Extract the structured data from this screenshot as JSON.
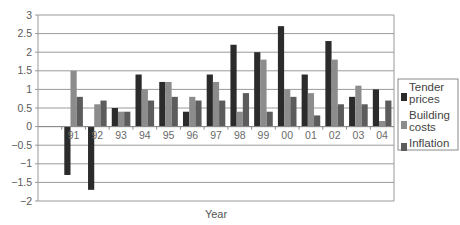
{
  "chart_data": {
    "type": "bar",
    "title": "",
    "xlabel": "Year",
    "ylabel": "",
    "ylim": [
      -2,
      3
    ],
    "yticks": [
      3,
      2.5,
      2,
      1.5,
      1,
      0.5,
      0,
      -0.5,
      -1,
      -1.5,
      -2
    ],
    "ytick_labels": [
      "3",
      "2.5",
      "2",
      "1.5",
      "1",
      "0.5",
      "0",
      "−0.5",
      "−1",
      "−1.5",
      "−2"
    ],
    "grid": true,
    "legend_position": "right",
    "categories": [
      "",
      "91",
      "92",
      "93",
      "94",
      "95",
      "96",
      "97",
      "98",
      "99",
      "00",
      "01",
      "02",
      "03",
      "04"
    ],
    "series": [
      {
        "name": "Tender prices",
        "color": "#2b2b2b",
        "values": [
          null,
          -1.3,
          -1.7,
          0.5,
          1.4,
          1.2,
          0.4,
          1.4,
          2.2,
          2.0,
          2.7,
          1.4,
          2.3,
          0.8,
          1.0
        ]
      },
      {
        "name": "Building costs",
        "color": "#8c8c8c",
        "values": [
          null,
          1.5,
          0.6,
          0.4,
          1.0,
          1.2,
          0.8,
          1.2,
          0.4,
          1.8,
          1.0,
          0.9,
          1.8,
          1.1,
          0.15
        ]
      },
      {
        "name": "Inflation",
        "color": "#5c5c5c",
        "values": [
          null,
          0.8,
          0.7,
          0.4,
          0.7,
          0.8,
          0.7,
          0.7,
          0.9,
          0.4,
          0.8,
          0.3,
          0.6,
          0.6,
          0.7
        ]
      }
    ]
  },
  "legend": {
    "items": [
      {
        "lines": [
          "Tender",
          "prices"
        ]
      },
      {
        "lines": [
          "Building",
          "costs"
        ]
      },
      {
        "lines": [
          "Inflation"
        ]
      }
    ]
  }
}
